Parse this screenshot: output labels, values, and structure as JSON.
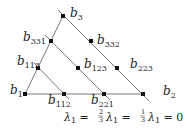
{
  "diagram": {
    "points": [
      {
        "id": "b1",
        "base": "b",
        "sub": "1",
        "x": 25,
        "y": 94
      },
      {
        "id": "b2",
        "base": "b",
        "sub": "2",
        "x": 143,
        "y": 94
      },
      {
        "id": "b3",
        "base": "b",
        "sub": "3",
        "x": 63,
        "y": 16
      },
      {
        "id": "b331",
        "base": "b",
        "sub": "331",
        "x": 51,
        "y": 41
      },
      {
        "id": "b332",
        "base": "b",
        "sub": "332",
        "x": 91,
        "y": 41
      },
      {
        "id": "b113",
        "base": "b",
        "sub": "113",
        "x": 38,
        "y": 68
      },
      {
        "id": "b123",
        "base": "b",
        "sub": "123",
        "x": 78,
        "y": 68
      },
      {
        "id": "b223",
        "base": "b",
        "sub": "223",
        "x": 117,
        "y": 68
      },
      {
        "id": "b112",
        "base": "b",
        "sub": "112",
        "x": 64,
        "y": 94
      },
      {
        "id": "b221",
        "base": "b",
        "sub": "221",
        "x": 104,
        "y": 94
      }
    ],
    "level_lines": [
      {
        "label": "λ1 = 2/3",
        "lhs": "λ",
        "lhs_sub": "1",
        "rhs": "2/3",
        "num": "2",
        "den": "3"
      },
      {
        "label": "λ1 = 1/3",
        "lhs": "λ",
        "lhs_sub": "1",
        "rhs": "1/3",
        "num": "1",
        "den": "3"
      },
      {
        "label": "λ1 = 0",
        "lhs": "λ",
        "lhs_sub": "1",
        "rhs": "0"
      }
    ],
    "colors": {
      "line": "#555555",
      "dot": "#111111",
      "text": "#222222"
    }
  }
}
